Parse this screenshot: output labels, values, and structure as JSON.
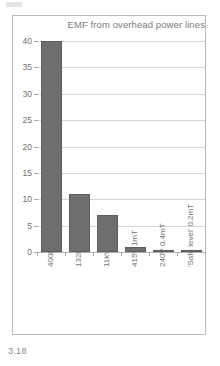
{
  "figure": {
    "caption": "3.18"
  },
  "chart_data": {
    "type": "bar",
    "title": "EMF from overhead power lines",
    "xlabel": "",
    "ylabel": "",
    "categories": [
      "400kV  40mT",
      "132kV  11mT",
      "11kV  7mT",
      "415V  1mT",
      "240V  0.4mT",
      "'Safe level'  0.2mT"
    ],
    "values": [
      40,
      11,
      7,
      1,
      0.4,
      0.2
    ],
    "ylim": [
      0,
      40
    ],
    "yticks": [
      0,
      5,
      10,
      15,
      20,
      25,
      30,
      35,
      40
    ],
    "ytick_labels": [
      "0",
      "5",
      "10",
      "15",
      "20",
      "25",
      "30",
      "35",
      "40"
    ],
    "grid": true,
    "legend": "none",
    "bar_color": "#6e6e6e",
    "grid_color": "#d6d6d6",
    "axis_color": "#b0b0b0",
    "text_color": "#6f6f6f"
  }
}
